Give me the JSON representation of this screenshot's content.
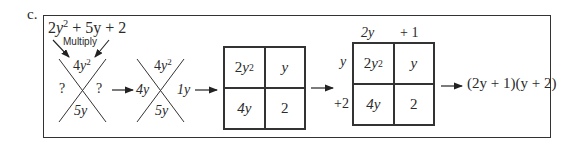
{
  "part_label": "c.",
  "step1": {
    "expression": {
      "coef_a": "2",
      "var": "y",
      "exp": "2",
      "rest": " + 5y + 2"
    },
    "multiply_label": "Multiply",
    "x_top": {
      "coef": "4",
      "var": "y",
      "exp": "2"
    },
    "x_bottom": "5y",
    "x_left": "?",
    "x_right": "?"
  },
  "step2": {
    "x_top": {
      "coef": "4",
      "var": "y",
      "exp": "2"
    },
    "x_bottom": "5y",
    "x_left": "4y",
    "x_right": "1y"
  },
  "step3": {
    "cells": [
      {
        "coef": "2",
        "var": "y",
        "exp": "2"
      },
      {
        "text": "y"
      },
      {
        "text": "4y"
      },
      {
        "text": "2"
      }
    ]
  },
  "step4": {
    "col_headers": [
      "2y",
      "+ 1"
    ],
    "row_headers": [
      "y",
      "+2"
    ],
    "cells": [
      {
        "coef": "2",
        "var": "y",
        "exp": "2"
      },
      {
        "text": "y"
      },
      {
        "text": "4y"
      },
      {
        "text": "2"
      }
    ]
  },
  "result": "(2y + 1)(y + 2)"
}
